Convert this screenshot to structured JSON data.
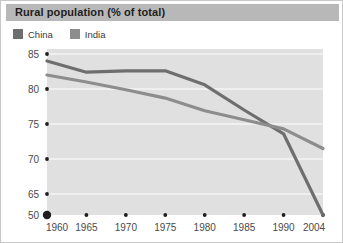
{
  "header": {
    "title": "Rural population (% of total)"
  },
  "legend": {
    "position": "top-left",
    "items": [
      {
        "label": "China",
        "color": "#6e6e6e",
        "swatch_name": "legend-swatch-china"
      },
      {
        "label": "India",
        "color": "#8d8d8d",
        "swatch_name": "legend-swatch-india"
      }
    ]
  },
  "chart_data": {
    "type": "line",
    "title": "Rural population (% of total)",
    "xlabel": "",
    "ylabel": "",
    "grid": true,
    "legend_position": "top-left",
    "x": [
      1960,
      1965,
      1970,
      1975,
      1980,
      1985,
      1990,
      2004
    ],
    "xtick_labels": [
      "1960",
      "1965",
      "1970",
      "1975",
      "1980",
      "1985",
      "1990",
      "2004"
    ],
    "ytick_labels": [
      "85",
      "80",
      "75",
      "70",
      "65",
      "50"
    ],
    "ytick_values": [
      85,
      80,
      75,
      70,
      65,
      50
    ],
    "ylim": [
      50,
      86.5
    ],
    "axis_origin_label": "50",
    "series": [
      {
        "name": "China",
        "color": "#6e6e6e",
        "values": [
          84.0,
          82.4,
          82.6,
          82.6,
          80.6,
          77.0,
          73.6,
          50.2
        ]
      },
      {
        "name": "India",
        "color": "#8d8d8d",
        "values": [
          82.0,
          81.0,
          79.9,
          78.7,
          76.9,
          75.6,
          74.3,
          71.5
        ]
      }
    ]
  }
}
